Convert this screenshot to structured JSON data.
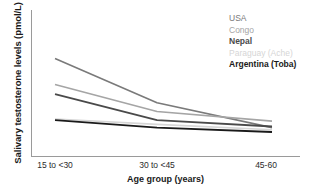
{
  "chart_data": {
    "type": "line",
    "title": "",
    "xlabel": "Age group (years)",
    "ylabel": "Salivary testosterone levels (pmol/L)",
    "categories": [
      "15 to <30",
      "30 to <45",
      "45-60"
    ],
    "grid": false,
    "legend_position": "top-right",
    "yticks": [],
    "axis_ranges": {
      "x": [
        0,
        2
      ],
      "y": [
        0,
        100
      ]
    },
    "series": [
      {
        "name": "USA",
        "color": "#7a7a7a",
        "weight": "normal",
        "values": [
          81,
          40,
          17
        ]
      },
      {
        "name": "Congo",
        "color": "#a5a5a5",
        "weight": "normal",
        "values": [
          57,
          32,
          23
        ]
      },
      {
        "name": "Nepal",
        "color": "#4a4a4a",
        "weight": "bold",
        "values": [
          48,
          24,
          18
        ]
      },
      {
        "name": "Paraguay (Ache)",
        "color": "#d6d6d6",
        "weight": "normal",
        "values": [
          25,
          20,
          15
        ]
      },
      {
        "name": "Argentina (Toba)",
        "color": "#1a1a1a",
        "weight": "bold",
        "values": [
          24,
          17,
          13
        ]
      }
    ]
  },
  "axes": {
    "y_title": "Salivary testosterone levels (pmol/L)",
    "x_title": "Age group (years)",
    "x_ticks": [
      "15 to <30",
      "30 to <45",
      "45-60"
    ]
  },
  "legend": {
    "items": [
      {
        "label": "USA",
        "color": "#7a7a7a",
        "weight": "normal"
      },
      {
        "label": "Congo",
        "color": "#a5a5a5",
        "weight": "normal"
      },
      {
        "label": "Nepal",
        "color": "#4a4a4a",
        "weight": "bold"
      },
      {
        "label": "Paraguay (Ache)",
        "color": "#d6d6d6",
        "weight": "normal"
      },
      {
        "label": "Argentina (Toba)",
        "color": "#1a1a1a",
        "weight": "bold"
      }
    ]
  },
  "colors": {
    "axis": "#9a9a9a",
    "background": "#ffffff",
    "text": "#1a1a1a"
  }
}
